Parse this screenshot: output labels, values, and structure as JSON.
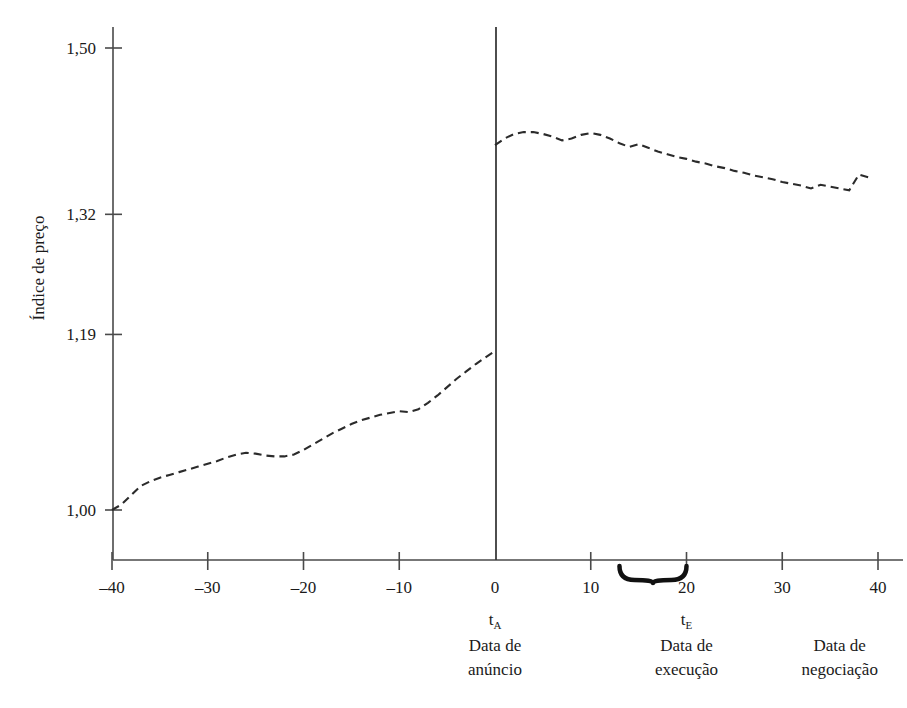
{
  "chart_data": {
    "type": "line",
    "title": "",
    "subtitle": "",
    "xlabel": "",
    "ylabel": "Índice de preço",
    "xlim": [
      -40,
      40
    ],
    "ylim": [
      0.955,
      1.535
    ],
    "grid": false,
    "legend": null,
    "line_style": "dashed",
    "line_color": "#2b2b2b",
    "axis_color": "#4a4a4a",
    "y_ticks": [
      {
        "value": 1.0,
        "label": "1,00"
      },
      {
        "value": 1.19,
        "label": "1,19"
      },
      {
        "value": 1.32,
        "label": "1,32"
      },
      {
        "value": 1.5,
        "label": "1,50"
      }
    ],
    "x_ticks": [
      {
        "value": -40,
        "label": "–40"
      },
      {
        "value": -30,
        "label": "–30"
      },
      {
        "value": -20,
        "label": "–20"
      },
      {
        "value": -10,
        "label": "–10"
      },
      {
        "value": 0,
        "label": "0"
      },
      {
        "value": 10,
        "label": "10"
      },
      {
        "value": 20,
        "label": "20"
      },
      {
        "value": 30,
        "label": "30"
      },
      {
        "value": 40,
        "label": "40"
      }
    ],
    "series": [
      {
        "name": "pre-announcement",
        "values": [
          [
            -40,
            1.0
          ],
          [
            -39,
            1.006
          ],
          [
            -38,
            1.016
          ],
          [
            -37,
            1.026
          ],
          [
            -36,
            1.031
          ],
          [
            -35,
            1.035
          ],
          [
            -34,
            1.038
          ],
          [
            -33,
            1.041
          ],
          [
            -32,
            1.044
          ],
          [
            -31,
            1.047
          ],
          [
            -30,
            1.05
          ],
          [
            -29,
            1.053
          ],
          [
            -28,
            1.057
          ],
          [
            -27,
            1.06
          ],
          [
            -26,
            1.062
          ],
          [
            -25,
            1.061
          ],
          [
            -24,
            1.059
          ],
          [
            -23,
            1.058
          ],
          [
            -22,
            1.058
          ],
          [
            -21,
            1.06
          ],
          [
            -20,
            1.065
          ],
          [
            -19,
            1.071
          ],
          [
            -18,
            1.077
          ],
          [
            -17,
            1.083
          ],
          [
            -16,
            1.088
          ],
          [
            -15,
            1.093
          ],
          [
            -14,
            1.097
          ],
          [
            -13,
            1.1
          ],
          [
            -12,
            1.103
          ],
          [
            -11,
            1.105
          ],
          [
            -10,
            1.107
          ],
          [
            -9,
            1.106
          ],
          [
            -8,
            1.109
          ],
          [
            -7,
            1.116
          ],
          [
            -6,
            1.124
          ],
          [
            -5,
            1.133
          ],
          [
            -4,
            1.142
          ],
          [
            -3,
            1.15
          ],
          [
            -2,
            1.158
          ],
          [
            -1,
            1.165
          ],
          [
            0,
            1.172
          ]
        ]
      },
      {
        "name": "post-announcement",
        "values": [
          [
            0,
            1.395
          ],
          [
            1,
            1.402
          ],
          [
            2,
            1.407
          ],
          [
            3,
            1.409
          ],
          [
            4,
            1.409
          ],
          [
            5,
            1.407
          ],
          [
            6,
            1.404
          ],
          [
            7,
            1.4
          ],
          [
            8,
            1.402
          ],
          [
            9,
            1.406
          ],
          [
            10,
            1.408
          ],
          [
            11,
            1.406
          ],
          [
            12,
            1.402
          ],
          [
            13,
            1.397
          ],
          [
            14,
            1.393
          ],
          [
            15,
            1.396
          ],
          [
            16,
            1.392
          ],
          [
            17,
            1.388
          ],
          [
            18,
            1.385
          ],
          [
            19,
            1.382
          ],
          [
            20,
            1.38
          ],
          [
            21,
            1.377
          ],
          [
            22,
            1.375
          ],
          [
            23,
            1.372
          ],
          [
            24,
            1.37
          ],
          [
            25,
            1.367
          ],
          [
            26,
            1.365
          ],
          [
            27,
            1.362
          ],
          [
            28,
            1.36
          ],
          [
            29,
            1.358
          ],
          [
            30,
            1.355
          ],
          [
            31,
            1.353
          ],
          [
            32,
            1.351
          ],
          [
            33,
            1.348
          ],
          [
            34,
            1.352
          ],
          [
            35,
            1.35
          ],
          [
            36,
            1.348
          ],
          [
            37,
            1.346
          ],
          [
            38,
            1.363
          ],
          [
            39,
            1.36
          ]
        ]
      }
    ],
    "event_line": {
      "value": 0,
      "label": ""
    },
    "brace": {
      "from": 13,
      "to": 20
    },
    "annotations": [
      {
        "id": "announcement",
        "symbol": "t",
        "subscript": "A",
        "line1": "Data de",
        "line2": "anúncio",
        "x_value": 0
      },
      {
        "id": "execution",
        "symbol": "t",
        "subscript": "E",
        "line1": "Data de",
        "line2": "execução",
        "x_value": 20
      },
      {
        "id": "trading",
        "symbol": "",
        "subscript": "",
        "line1": "Data de",
        "line2": "negociação",
        "x_value": 36
      }
    ]
  }
}
